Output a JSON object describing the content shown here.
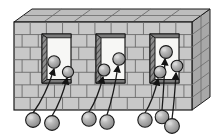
{
  "figure": {
    "type": "technical-illustration",
    "background_color": "#ffffff",
    "canvas": {
      "width": 217,
      "height": 139
    }
  },
  "palette": {
    "brick_face": "#c8c8c8",
    "brick_face_light": "#d2d2d2",
    "mortar_line": "#6b6b6b",
    "wall_top": "#bdbdbd",
    "wall_top_light": "#cfcfcf",
    "wall_end": "#a8a8a8",
    "reveal_dark": "#7a7a7a",
    "reveal_hatch": "#4f4f4f",
    "opening_fill": "#f7f7f5",
    "sphere_fill": "#a9a9a9",
    "sphere_highlight": "#d8d8d8",
    "sphere_shadow": "#7d7d7d",
    "outline": "#1a1a1a",
    "tether_line": "#1a1a1a"
  },
  "wall": {
    "name": "brick-wall",
    "front_face": {
      "x": 14,
      "y": 22,
      "width": 178,
      "height": 88
    },
    "top_face": {
      "depth_x": 18,
      "depth_y": -13
    },
    "brick_courses": 7,
    "bricks_per_course": 11,
    "course_height": 12.6,
    "top_segments": 6
  },
  "openings": [
    {
      "name": "window-opening-left",
      "index": 1,
      "x": 42,
      "y": 34,
      "width": 29,
      "height": 49,
      "reveal_side": "left",
      "reveal_width": 5
    },
    {
      "name": "window-opening-middle",
      "index": 2,
      "x": 96,
      "y": 34,
      "width": 29,
      "height": 49,
      "reveal_side": "left",
      "reveal_width": 5
    },
    {
      "name": "window-opening-right",
      "index": 3,
      "x": 150,
      "y": 34,
      "width": 29,
      "height": 49,
      "reveal_side": "left",
      "reveal_width": 5
    }
  ],
  "inner_spheres": [
    {
      "name": "inner-sphere-1",
      "opening": 1,
      "cx": 54,
      "cy": 62,
      "r": 6.2
    },
    {
      "name": "inner-sphere-2",
      "opening": 1,
      "cx": 68,
      "cy": 72,
      "r": 5.6
    },
    {
      "name": "inner-sphere-3",
      "opening": 2,
      "cx": 104,
      "cy": 70,
      "r": 6.0
    },
    {
      "name": "inner-sphere-4",
      "opening": 2,
      "cx": 119,
      "cy": 59,
      "r": 6.2
    },
    {
      "name": "inner-sphere-5",
      "opening": 3,
      "cx": 166,
      "cy": 52,
      "r": 6.4
    },
    {
      "name": "inner-sphere-6",
      "opening": 3,
      "cx": 160,
      "cy": 72,
      "r": 6.0
    },
    {
      "name": "inner-sphere-7",
      "opening": 3,
      "cx": 177,
      "cy": 66,
      "r": 5.8
    }
  ],
  "outer_spheres": [
    {
      "name": "outer-sphere-1",
      "cx": 33,
      "cy": 120,
      "r": 7.4
    },
    {
      "name": "outer-sphere-2",
      "cx": 52,
      "cy": 123,
      "r": 7.4
    },
    {
      "name": "outer-sphere-3",
      "cx": 89,
      "cy": 119,
      "r": 7.2
    },
    {
      "name": "outer-sphere-4",
      "cx": 107,
      "cy": 122,
      "r": 7.2
    },
    {
      "name": "outer-sphere-5",
      "cx": 145,
      "cy": 120,
      "r": 7.2
    },
    {
      "name": "outer-sphere-6",
      "cx": 162,
      "cy": 117,
      "r": 6.8
    },
    {
      "name": "outer-sphere-7",
      "cx": 172,
      "cy": 126,
      "r": 7.4
    }
  ],
  "tethers": [
    {
      "name": "tether-1",
      "from_outer": 1,
      "to_inner": 1,
      "x1": 33,
      "y1": 113,
      "x2": 54,
      "y2": 69,
      "arrow": true
    },
    {
      "name": "tether-2",
      "from_outer": 2,
      "to_inner": 2,
      "x1": 52,
      "y1": 116,
      "x2": 67,
      "y2": 78,
      "arrow": true
    },
    {
      "name": "tether-3",
      "from_outer": 3,
      "to_inner": 3,
      "x1": 89,
      "y1": 112,
      "x2": 103,
      "y2": 77,
      "arrow": true
    },
    {
      "name": "tether-4",
      "from_outer": 4,
      "to_inner": 4,
      "x1": 107,
      "y1": 115,
      "x2": 118,
      "y2": 66,
      "arrow": true
    },
    {
      "name": "tether-5",
      "from_outer": 5,
      "to_inner": 6,
      "x1": 145,
      "y1": 113,
      "x2": 158,
      "y2": 79,
      "arrow": true
    },
    {
      "name": "tether-6",
      "from_outer": 6,
      "to_inner": 5,
      "x1": 162,
      "y1": 110,
      "x2": 165,
      "y2": 59,
      "arrow": true
    },
    {
      "name": "tether-7",
      "from_outer": 7,
      "to_inner": 7,
      "x1": 172,
      "y1": 119,
      "x2": 176,
      "y2": 73,
      "arrow": true
    }
  ],
  "counts": {
    "openings": 3,
    "inner_spheres": 7,
    "outer_spheres": 7,
    "tethers": 7
  }
}
